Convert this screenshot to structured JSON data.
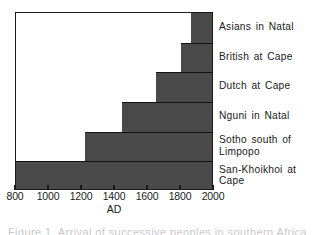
{
  "figure": {
    "background_color": "#ffffff",
    "bar_color": "#4a4a4a",
    "axis_color": "#1a1a1a",
    "caption_partial": "Figure 1. Arrival of successive peoples in southern Africa"
  },
  "chart_data": {
    "type": "bar",
    "orientation": "horizontal",
    "title": "",
    "subtitle": "",
    "xlabel": "AD",
    "ylabel": "",
    "xlim": [
      800,
      2000
    ],
    "xticks": [
      800,
      1000,
      1200,
      1400,
      1600,
      1800,
      2000
    ],
    "xtick_labels": [
      "800",
      "1000",
      "1200",
      "1400",
      "1600",
      "1800",
      "2000"
    ],
    "grid": false,
    "legend": "right-side row labels",
    "note": "Each row is a horizontal bar spanning from the group's arrival/start year to the present (2000 AD).",
    "categories": [
      "Asians in Natal",
      "British at Cape",
      "Dutch at Cape",
      "Nguni in Natal",
      "Sotho south of Limpopo",
      "San-Khoikhoi at Cape"
    ],
    "start_values": [
      1860,
      1800,
      1650,
      1440,
      1220,
      800
    ],
    "end_values": [
      2000,
      2000,
      2000,
      2000,
      2000,
      2000
    ],
    "values": [
      140,
      200,
      350,
      560,
      780,
      1200
    ],
    "rows": [
      {
        "label": "Asians in Natal",
        "start": 1860,
        "end": 2000,
        "duration": 140
      },
      {
        "label": "British at Cape",
        "start": 1800,
        "end": 2000,
        "duration": 200
      },
      {
        "label": "Dutch at Cape",
        "start": 1650,
        "end": 2000,
        "duration": 350
      },
      {
        "label": "Nguni in Natal",
        "start": 1440,
        "end": 2000,
        "duration": 560
      },
      {
        "label": "Sotho south of\nLimpopo",
        "start": 1220,
        "end": 2000,
        "duration": 780
      },
      {
        "label": "San-Khoikhoi at\nCape",
        "start": 800,
        "end": 2000,
        "duration": 1200
      }
    ]
  }
}
